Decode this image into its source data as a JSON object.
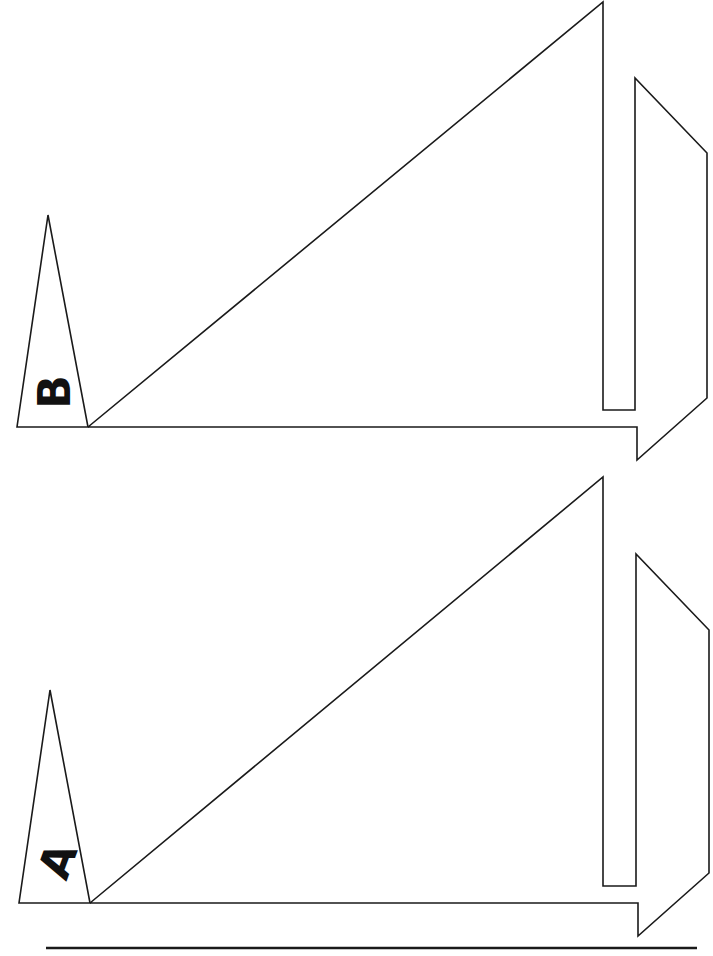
{
  "diagram": {
    "background": "#ffffff",
    "stroke_color": "#1a1a1a",
    "figures": [
      {
        "id": "B",
        "label": "B",
        "label_rotation_deg": -90,
        "small_triangle": {
          "apex": [
            48,
            215
          ],
          "base_left": [
            17,
            427
          ],
          "base_right": [
            88,
            427
          ]
        },
        "large_shape_points": [
          [
            88,
            427
          ],
          [
            603,
            2
          ],
          [
            603,
            410
          ],
          [
            635,
            410
          ],
          [
            635,
            78
          ],
          [
            707,
            153
          ],
          [
            707,
            398
          ],
          [
            637,
            460
          ],
          [
            637,
            427
          ],
          [
            88,
            427
          ]
        ]
      },
      {
        "id": "A",
        "label": "A",
        "label_rotation_deg": -90,
        "small_triangle": {
          "apex": [
            50,
            690
          ],
          "base_left": [
            19,
            903
          ],
          "base_right": [
            90,
            903
          ]
        },
        "large_shape_points": [
          [
            90,
            903
          ],
          [
            603,
            477
          ],
          [
            603,
            886
          ],
          [
            636,
            886
          ],
          [
            636,
            554
          ],
          [
            709,
            630
          ],
          [
            709,
            873
          ],
          [
            638,
            936
          ],
          [
            638,
            903
          ],
          [
            90,
            903
          ]
        ]
      }
    ],
    "bottom_rule": {
      "x1": 46,
      "y1": 948,
      "x2": 697,
      "y2": 948
    }
  }
}
